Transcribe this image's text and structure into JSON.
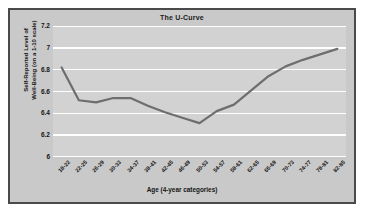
{
  "chart_data": {
    "type": "line",
    "title": "The U-Curve",
    "xlabel": "Age (4-year categories)",
    "ylabel": "Self-Reported Level of Well-Being (on a 1-10 scale)",
    "ylabel_line1": "Self-Reported Level of",
    "ylabel_line2": "Well-Being (on a 1-10 scale)",
    "categories": [
      "18-22",
      "22-25",
      "26-29",
      "30-33",
      "34-37",
      "38-41",
      "42-45",
      "46-49",
      "50-53",
      "54-57",
      "58-61",
      "62-65",
      "66-69",
      "70-73",
      "74-77",
      "78-81",
      "82-85"
    ],
    "values": [
      6.82,
      6.52,
      6.5,
      6.54,
      6.54,
      6.47,
      6.41,
      6.36,
      6.31,
      6.42,
      6.48,
      6.61,
      6.74,
      6.83,
      6.89,
      6.94,
      6.99
    ],
    "yticks": [
      "7.2",
      "7",
      "6.8",
      "6.6",
      "6.4",
      "6.2",
      "6"
    ],
    "ytick_values": [
      7.2,
      7.0,
      6.8,
      6.6,
      6.4,
      6.2,
      6.0
    ],
    "ylim": [
      6.0,
      7.2
    ],
    "grid": true,
    "legend": "none",
    "series_color": "#6e6e6e",
    "plot_background": "#d2d2d2",
    "frame_background": "#c9c9c9",
    "gridline_color": "#ffffff",
    "border_color": "#4a4a4a"
  }
}
